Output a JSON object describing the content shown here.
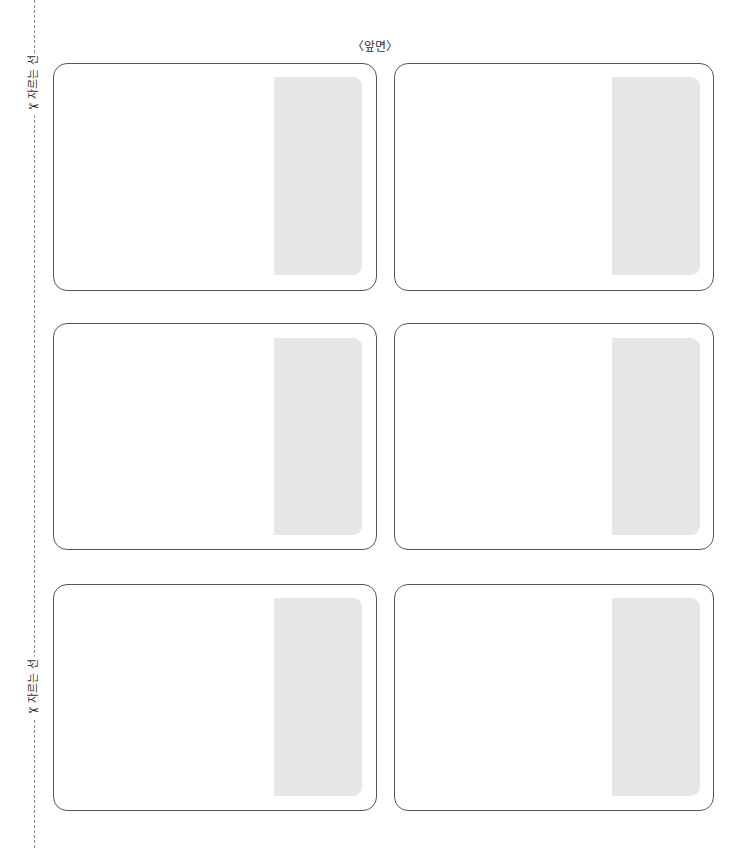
{
  "page": {
    "title": "〈앞면〉"
  },
  "cut_guides": [
    {
      "label": "자르는 선",
      "icon": "scissors-icon"
    },
    {
      "label": "자르는 선",
      "icon": "scissors-icon"
    }
  ],
  "cards": [
    {
      "position": "row1-left",
      "panel_color": "#e6e6e6"
    },
    {
      "position": "row1-right",
      "panel_color": "#e6e6e6"
    },
    {
      "position": "row2-left",
      "panel_color": "#e6e6e6"
    },
    {
      "position": "row2-right",
      "panel_color": "#e6e6e6"
    },
    {
      "position": "row3-left",
      "panel_color": "#e6e6e6"
    },
    {
      "position": "row3-right",
      "panel_color": "#e6e6e6"
    }
  ],
  "colors": {
    "card_border": "#555555",
    "panel": "#e6e6e6",
    "cut_line": "#8a8a8a"
  }
}
